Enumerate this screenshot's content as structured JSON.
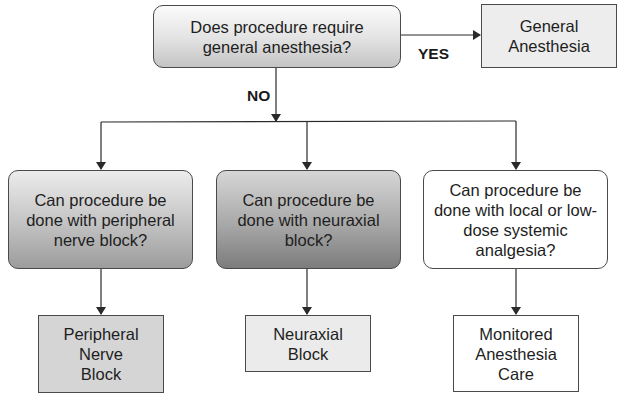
{
  "diagram": {
    "type": "flowchart",
    "nodes": {
      "q_general": {
        "lines": [
          "Does procedure require",
          "general anesthesia?"
        ],
        "shape": "rounded-rect",
        "fill": "gradient-light-gray"
      },
      "r_general": {
        "lines": [
          "General",
          "Anesthesia"
        ],
        "shape": "rect",
        "fill": "#ededed"
      },
      "q_peripheral": {
        "lines": [
          "Can procedure be",
          "done with peripheral",
          "nerve block?"
        ],
        "shape": "rounded-rect",
        "fill": "gradient-medium-gray"
      },
      "q_neuraxial": {
        "lines": [
          "Can procedure be",
          "done with neuraxial",
          "block?"
        ],
        "shape": "rounded-rect",
        "fill": "gradient-dark-gray"
      },
      "q_local": {
        "lines": [
          "Can procedure be",
          "done with local or low-",
          "dose systemic",
          "analgesia?"
        ],
        "shape": "rounded-rect",
        "fill": "#ffffff"
      },
      "r_peripheral": {
        "lines": [
          "Peripheral",
          "Nerve",
          "Block"
        ],
        "shape": "rect",
        "fill": "#d5d5d5"
      },
      "r_neuraxial": {
        "lines": [
          "Neuraxial",
          "Block"
        ],
        "shape": "rect",
        "fill": "#ebebeb"
      },
      "r_mac": {
        "lines": [
          "Monitored",
          "Anesthesia",
          "Care"
        ],
        "shape": "rect",
        "fill": "#ffffff"
      }
    },
    "edges": [
      {
        "from": "q_general",
        "to": "r_general",
        "label": "YES"
      },
      {
        "from": "q_general",
        "to": "q_peripheral",
        "label": "NO"
      },
      {
        "from": "q_general",
        "to": "q_neuraxial",
        "label": "NO"
      },
      {
        "from": "q_general",
        "to": "q_local",
        "label": "NO"
      },
      {
        "from": "q_peripheral",
        "to": "r_peripheral",
        "label": ""
      },
      {
        "from": "q_neuraxial",
        "to": "r_neuraxial",
        "label": ""
      },
      {
        "from": "q_local",
        "to": "r_mac",
        "label": ""
      }
    ],
    "labels": {
      "yes": "YES",
      "no": "NO"
    },
    "colors": {
      "line": "#2a2a2a",
      "border": "#4a4a4a",
      "text": "#1e1e1e"
    }
  }
}
